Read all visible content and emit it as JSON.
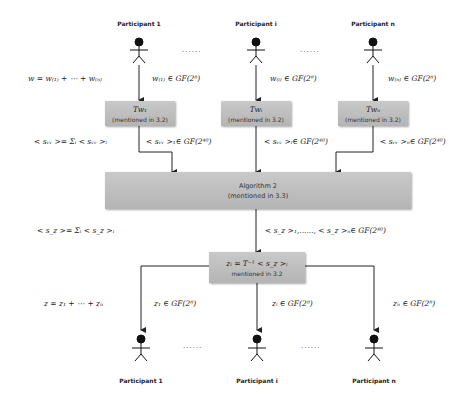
{
  "top_participants": [
    {
      "label": "Participant 1",
      "share_label": "w₍₁₎ ∈ GF(2⁸)"
    },
    {
      "label": "Participant i",
      "share_label": "w₍ᵢ₎ ∈ GF(2⁸)"
    },
    {
      "label": "Participant n",
      "share_label": "w₍ₙ₎ ∈ GF(2⁸)"
    }
  ],
  "top_dots": "......",
  "sum_label_top": "w = w₍₁₎ + ⋯ + w₍ₙ₎",
  "transform_boxes": [
    {
      "title": "Tw₁",
      "subtitle": "(mentioned in 3.2)",
      "output_label": "< sᵥᵥ >₁∈ GF(2⁴⁰)"
    },
    {
      "title": "Twᵢ",
      "subtitle": "(mentioned in 3.2)",
      "output_label": "< sᵥᵥ >ᵢ∈ GF(2⁴⁰)"
    },
    {
      "title": "Twₙ",
      "subtitle": "(mentioned in 3.2)",
      "output_label": "< sᵥᵥ >ₙ∈ GF(2⁴⁰)"
    }
  ],
  "sum_label_sw": "< sᵥᵥ >= Σᵢ < sᵥᵥ >ᵢ",
  "algorithm_box": {
    "title": "Algorithm 2",
    "subtitle": "(mentioned in 3.3)"
  },
  "sum_label_sz": "< s_z >= Σᵢ < s_z >ᵢ",
  "algorithm_output_label": "< s_z >₁,......, < s_z >ₙ∈ GF(2⁴⁰)",
  "inverse_box": {
    "title": "zᵢ = T⁻¹ < s_z >ᵢ",
    "subtitle": "mentioned in 3.2"
  },
  "sum_label_bottom": "z = z₁ + ⋯ + zₙ",
  "bottom_participants": [
    {
      "label": "Participant 1",
      "share_label": "z₁ ∈ GF(2⁸)"
    },
    {
      "label": "Participant i",
      "share_label": "zᵢ ∈ GF(2⁸)"
    },
    {
      "label": "Participant n",
      "share_label": "zₙ ∈ GF(2⁸)"
    }
  ],
  "bottom_dots": "......"
}
